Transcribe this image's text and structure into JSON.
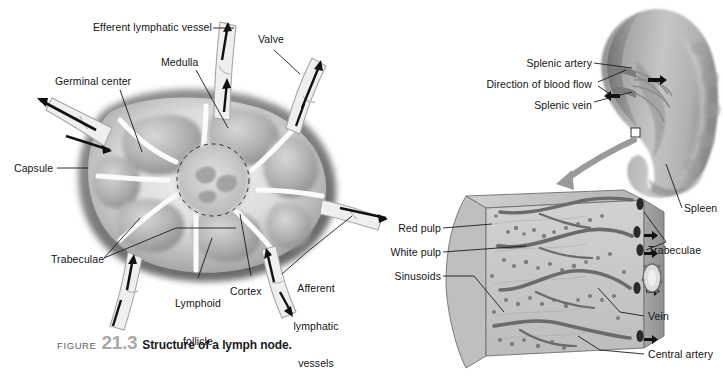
{
  "figure": {
    "word": "FIGURE",
    "number": "21.3",
    "title": "Structure of a lymph node."
  },
  "lymph_node": {
    "labels": {
      "efferent": "Efferent lymphatic vessel",
      "valve": "Valve",
      "medulla": "Medulla",
      "germinal_center": "Germinal center",
      "capsule": "Capsule",
      "trabeculae": "Trabeculae",
      "lymphoid_follicle_l1": "Lymphoid",
      "lymphoid_follicle_l2": "follicle",
      "cortex": "Cortex",
      "afferent_l1": "Afferent",
      "afferent_l2": "lymphatic",
      "afferent_l3": "vessels"
    }
  },
  "spleen": {
    "labels": {
      "splenic_artery": "Splenic artery",
      "direction_of_blood_flow": "Direction of blood flow",
      "splenic_vein": "Splenic vein",
      "spleen": "Spleen",
      "red_pulp": "Red pulp",
      "white_pulp": "White pulp",
      "sinusoids": "Sinusoids",
      "trabeculae": "Trabeculae",
      "vein": "Vein",
      "central_artery": "Central artery"
    }
  },
  "colors": {
    "background": "#ffffff",
    "leader_line": "#1a1a1a",
    "capsule_dark": "#6e6e6e",
    "cortex_light": "#efefef",
    "medulla_mid": "#b8b8b8",
    "spleen_body": "#b9b9b9",
    "spleen_shadow": "#7d7d7d",
    "block_face": "#cfcfcf",
    "block_side": "#a8a8a8",
    "caption_number": "#a9a9a9",
    "caption_word": "#5c5c5c"
  }
}
